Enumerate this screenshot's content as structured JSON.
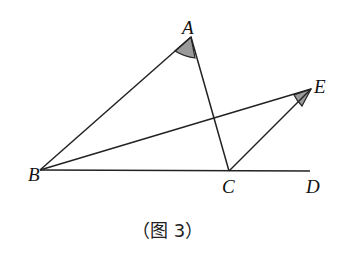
{
  "figure": {
    "caption": "（图 3）",
    "points": {
      "A": {
        "label": "A",
        "x": 191,
        "y": 37
      },
      "B": {
        "label": "B",
        "x": 40,
        "y": 170
      },
      "C": {
        "label": "C",
        "x": 229,
        "y": 171
      },
      "D": {
        "label": "D",
        "x": 310,
        "y": 171
      },
      "E": {
        "label": "E",
        "x": 311,
        "y": 89
      }
    },
    "segments": [
      "AB",
      "AC",
      "BC",
      "CD",
      "BE",
      "CE"
    ],
    "marked_angles": [
      "angle-A (BAC)",
      "angle-E (BEC)"
    ],
    "colors": {
      "line": "#222222",
      "shade": "#9a9a9a",
      "background": "#ffffff"
    }
  }
}
